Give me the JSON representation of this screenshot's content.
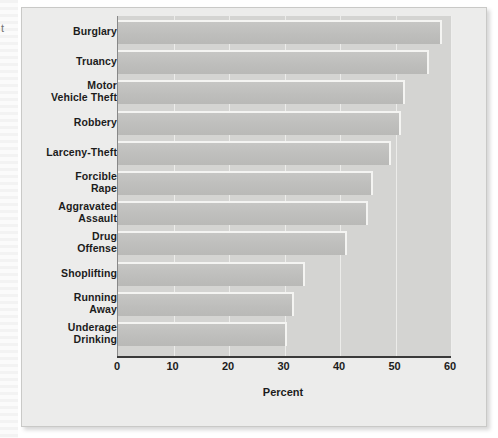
{
  "page": {
    "bleed_glyph": "t"
  },
  "chart_data": {
    "type": "bar",
    "orientation": "horizontal",
    "title": "",
    "subtitle": "",
    "xlabel": "Percent",
    "ylabel": "",
    "xlim": [
      0,
      60
    ],
    "xticks": [
      0,
      10,
      20,
      30,
      40,
      50,
      60
    ],
    "xtick_labels": [
      "0",
      "10",
      "20",
      "30",
      "40",
      "50",
      "60"
    ],
    "grid": "vertical-white-gridlines",
    "legend": "none",
    "categories": [
      "Burglary",
      "Truancy",
      "Motor\nVehicle Theft",
      "Robbery",
      "Larceny-Theft",
      "Forcible\nRape",
      "Aggravated\nAssault",
      "Drug\nOffense",
      "Shoplifting",
      "Running\nAway",
      "Underage\nDrinking"
    ],
    "values": [
      58.4,
      56.0,
      51.8,
      51.0,
      49.1,
      45.9,
      45.1,
      41.2,
      33.7,
      31.7,
      30.5
    ],
    "series": [
      {
        "name": "Percent",
        "values": [
          58.4,
          56.0,
          51.8,
          51.0,
          49.1,
          45.9,
          45.1,
          41.2,
          33.7,
          31.7,
          30.5
        ]
      }
    ]
  },
  "colors": {
    "bar_fill": "#bebebc",
    "bar_highlight": "#f4f4f2",
    "bar_shadow": "#5d5d5d",
    "plot_background": "#d4d4d2",
    "figure_background": "#ececeb",
    "gridline": "#f0f0ee",
    "axis": "#3a3a3a",
    "text": "#1c1c1c"
  }
}
